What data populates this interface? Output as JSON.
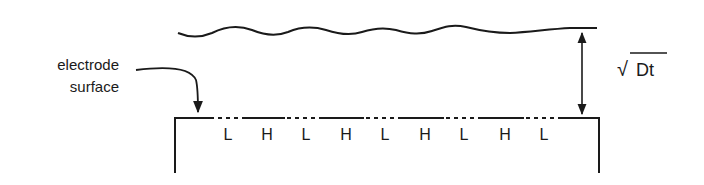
{
  "diagram": {
    "labels": {
      "electrode_line1": "electrode",
      "electrode_line2": "surface",
      "diffusion_length_root": "√",
      "diffusion_length_expr": "Dt"
    },
    "surface_regions": [
      {
        "label": "L",
        "type": "dashed"
      },
      {
        "label": "H",
        "type": "solid"
      },
      {
        "label": "L",
        "type": "dashed"
      },
      {
        "label": "H",
        "type": "solid"
      },
      {
        "label": "L",
        "type": "dashed"
      },
      {
        "label": "H",
        "type": "solid"
      },
      {
        "label": "L",
        "type": "dashed"
      },
      {
        "label": "H",
        "type": "solid"
      },
      {
        "label": "L",
        "type": "dashed"
      }
    ],
    "colors": {
      "ink": "#1a1a1a",
      "background": "#ffffff"
    }
  }
}
